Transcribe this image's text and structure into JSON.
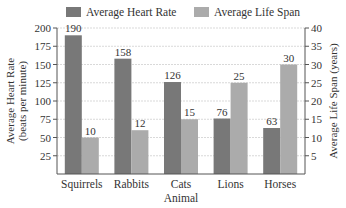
{
  "chart_data": {
    "type": "bar",
    "title": "",
    "categories": [
      "Squirrels",
      "Rabbits",
      "Cats",
      "Lions",
      "Horses"
    ],
    "series": [
      {
        "name": "Average Heart Rate",
        "axis": "left",
        "color": "#787878",
        "values": [
          190,
          158,
          126,
          76,
          63
        ]
      },
      {
        "name": "Average Life Span",
        "axis": "right",
        "color": "#ababab",
        "values": [
          10,
          12,
          15,
          25,
          30
        ]
      }
    ],
    "xlabel": "Animal",
    "ylabel": "Average Heart Rate\n(beats per minute)",
    "ylabel_lines": [
      "Average Heart Rate",
      "(beats per minute)"
    ],
    "y2label": "Average Life Span (years)",
    "ylim": [
      0,
      200
    ],
    "y2lim": [
      0,
      40
    ],
    "yticks": [
      25,
      50,
      75,
      100,
      125,
      150,
      175,
      200
    ],
    "y2ticks": [
      5,
      10,
      15,
      20,
      25,
      30,
      35,
      40
    ],
    "grid": true,
    "legend_position": "top"
  }
}
